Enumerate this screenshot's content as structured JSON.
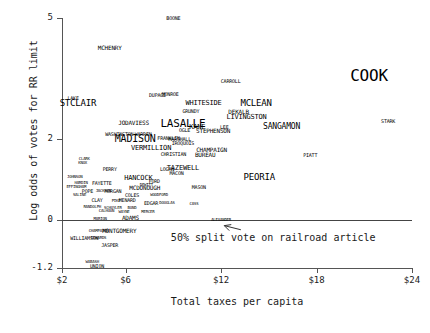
{
  "chart_data": {
    "type": "scatter",
    "title": "",
    "xlabel": "Total taxes per capita",
    "ylabel": "Log odds of votes for RR limit",
    "xlim": [
      2,
      24
    ],
    "ylim": [
      -1.2,
      5
    ],
    "xticks": [
      "$2",
      "$6",
      "$12",
      "$18",
      "$24"
    ],
    "xtick_values": [
      2,
      6,
      12,
      18,
      24
    ],
    "yticks": [
      "5",
      "2",
      "0",
      "-1.2"
    ],
    "ytick_values": [
      5,
      2,
      0,
      -1.2
    ],
    "grid": false,
    "legend": "none",
    "annotations": [
      {
        "text": "50% split vote on railroad article",
        "x": 14.5,
        "y": -0.45,
        "arrow_to_x": 12.2,
        "arrow_to_y": 0.0
      }
    ],
    "reference_lines": [
      {
        "y": 0,
        "label": "50% split vote on railroad article"
      }
    ],
    "point_label_field": "county",
    "points": [
      {
        "county": "BOONE",
        "x": 9.0,
        "y": 5.0,
        "size": 5
      },
      {
        "county": "MCHENRY",
        "x": 5.0,
        "y": 4.25,
        "size": 6
      },
      {
        "county": "CARROLL",
        "x": 12.6,
        "y": 3.45,
        "size": 5
      },
      {
        "county": "DUPAGE",
        "x": 8.0,
        "y": 3.1,
        "size": 5
      },
      {
        "county": "MONROE",
        "x": 8.8,
        "y": 3.12,
        "size": 5
      },
      {
        "county": "LAKE",
        "x": 2.7,
        "y": 3.02,
        "size": 5
      },
      {
        "county": "STCLAIR",
        "x": 3.0,
        "y": 2.9,
        "size": 9
      },
      {
        "county": "WHITESIDE",
        "x": 10.9,
        "y": 2.88,
        "size": 7
      },
      {
        "county": "MCLEAN",
        "x": 14.2,
        "y": 2.9,
        "size": 9
      },
      {
        "county": "GRUNDY",
        "x": 10.1,
        "y": 2.7,
        "size": 5
      },
      {
        "county": "DEKALB",
        "x": 13.1,
        "y": 2.68,
        "size": 6
      },
      {
        "county": "LIVINGSTON",
        "x": 13.6,
        "y": 2.55,
        "size": 7
      },
      {
        "county": "JODAVIESS",
        "x": 6.5,
        "y": 2.4,
        "size": 6
      },
      {
        "county": "LASALLE",
        "x": 9.6,
        "y": 2.4,
        "size": 11
      },
      {
        "county": "KANE",
        "x": 10.5,
        "y": 2.3,
        "size": 7
      },
      {
        "county": "LEE",
        "x": 12.2,
        "y": 2.3,
        "size": 5
      },
      {
        "county": "OGLE",
        "x": 9.7,
        "y": 2.22,
        "size": 5
      },
      {
        "county": "STEPHENSON",
        "x": 11.5,
        "y": 2.2,
        "size": 6
      },
      {
        "county": "WASHINGTON",
        "x": 5.6,
        "y": 2.12,
        "size": 5
      },
      {
        "county": "WARREN",
        "x": 7.1,
        "y": 2.12,
        "size": 5
      },
      {
        "county": "MADISON",
        "x": 6.6,
        "y": 2.0,
        "size": 10
      },
      {
        "county": "MARSHALL",
        "x": 9.4,
        "y": 2.0,
        "size": 5
      },
      {
        "county": "FRANKLIN",
        "x": 8.7,
        "y": 2.02,
        "size": 5
      },
      {
        "county": "IROQUOIS",
        "x": 9.6,
        "y": 1.9,
        "size": 5
      },
      {
        "county": "VERMILLION",
        "x": 7.6,
        "y": 1.78,
        "size": 7
      },
      {
        "county": "CHAMPAIGN",
        "x": 11.4,
        "y": 1.72,
        "size": 6
      },
      {
        "county": "CHRISTIAN",
        "x": 9.0,
        "y": 1.62,
        "size": 5
      },
      {
        "county": "BUREAU",
        "x": 11.0,
        "y": 1.6,
        "size": 6
      },
      {
        "county": "CLARK",
        "x": 3.4,
        "y": 1.5,
        "size": 4
      },
      {
        "county": "KNOX",
        "x": 3.3,
        "y": 1.4,
        "size": 4
      },
      {
        "county": "PERRY",
        "x": 5.0,
        "y": 1.25,
        "size": 5
      },
      {
        "county": "LOGAN",
        "x": 8.6,
        "y": 1.25,
        "size": 5
      },
      {
        "county": "TAZEWELL",
        "x": 9.6,
        "y": 1.28,
        "size": 7
      },
      {
        "county": "MACON",
        "x": 9.2,
        "y": 1.15,
        "size": 5
      },
      {
        "county": "JOHNSON",
        "x": 2.8,
        "y": 1.05,
        "size": 4
      },
      {
        "county": "HANCOCK",
        "x": 6.8,
        "y": 1.02,
        "size": 7
      },
      {
        "county": "PEORIA",
        "x": 14.4,
        "y": 1.05,
        "size": 9
      },
      {
        "county": "HARDIN",
        "x": 3.2,
        "y": 0.92,
        "size": 4
      },
      {
        "county": "FAYETTE",
        "x": 4.5,
        "y": 0.92,
        "size": 5
      },
      {
        "county": "FORD",
        "x": 7.8,
        "y": 0.95,
        "size": 5
      },
      {
        "county": "DEWITT",
        "x": 7.3,
        "y": 0.85,
        "size": 4
      },
      {
        "county": "EFFINGHAM",
        "x": 2.9,
        "y": 0.8,
        "size": 4
      },
      {
        "county": "MCDONOUGH",
        "x": 7.2,
        "y": 0.78,
        "size": 6
      },
      {
        "county": "MASON",
        "x": 10.6,
        "y": 0.82,
        "size": 5
      },
      {
        "county": "POPE",
        "x": 3.6,
        "y": 0.72,
        "size": 5
      },
      {
        "county": "JACKSON",
        "x": 4.6,
        "y": 0.7,
        "size": 4
      },
      {
        "county": "MORGAN",
        "x": 5.2,
        "y": 0.72,
        "size": 5
      },
      {
        "county": "SALINE",
        "x": 3.1,
        "y": 0.6,
        "size": 4
      },
      {
        "county": "COLES",
        "x": 6.4,
        "y": 0.6,
        "size": 5
      },
      {
        "county": "WOODFORD",
        "x": 8.1,
        "y": 0.6,
        "size": 4
      },
      {
        "county": "CLAY",
        "x": 4.2,
        "y": 0.48,
        "size": 5
      },
      {
        "county": "MENARD",
        "x": 6.1,
        "y": 0.48,
        "size": 5
      },
      {
        "county": "PIKE",
        "x": 5.4,
        "y": 0.45,
        "size": 4
      },
      {
        "county": "EDGAR",
        "x": 7.6,
        "y": 0.42,
        "size": 5
      },
      {
        "county": "DOUGLAS",
        "x": 8.6,
        "y": 0.42,
        "size": 4
      },
      {
        "county": "CASS",
        "x": 10.3,
        "y": 0.38,
        "size": 4
      },
      {
        "county": "RANDOLPH",
        "x": 3.9,
        "y": 0.32,
        "size": 4
      },
      {
        "county": "SCHUYLER",
        "x": 5.2,
        "y": 0.3,
        "size": 4
      },
      {
        "county": "BOND",
        "x": 6.4,
        "y": 0.3,
        "size": 4
      },
      {
        "county": "CALHOUN",
        "x": 4.8,
        "y": 0.22,
        "size": 4
      },
      {
        "county": "WAYNE",
        "x": 5.9,
        "y": 0.2,
        "size": 4
      },
      {
        "county": "MERCER",
        "x": 7.4,
        "y": 0.2,
        "size": 4
      },
      {
        "county": "ADAMS",
        "x": 6.3,
        "y": 0.05,
        "size": 6
      },
      {
        "county": "MARION",
        "x": 4.4,
        "y": 0.02,
        "size": 4
      },
      {
        "county": "ALEXANDER",
        "x": 12.0,
        "y": 0.0,
        "size": 4
      },
      {
        "county": "CHAMPAIGN2",
        "x": 4.3,
        "y": -0.28,
        "size": 4
      },
      {
        "county": "MONTGOMERY",
        "x": 5.6,
        "y": -0.28,
        "size": 6
      },
      {
        "county": "WILLIAMSON",
        "x": 3.4,
        "y": -0.45,
        "size": 5
      },
      {
        "county": "EDWARDS",
        "x": 4.3,
        "y": -0.45,
        "size": 4
      },
      {
        "county": "JASPER",
        "x": 5.0,
        "y": -0.62,
        "size": 5
      },
      {
        "county": "WABASH",
        "x": 3.9,
        "y": -1.05,
        "size": 4
      },
      {
        "county": "UNION",
        "x": 4.2,
        "y": -1.15,
        "size": 5
      },
      {
        "county": "STARK",
        "x": 22.5,
        "y": 2.45,
        "size": 5
      },
      {
        "county": "PIATT",
        "x": 17.6,
        "y": 1.6,
        "size": 5
      },
      {
        "county": "SANGAMON",
        "x": 15.8,
        "y": 2.3,
        "size": 8
      },
      {
        "county": "COOK",
        "x": 21.3,
        "y": 3.55,
        "size": 16
      }
    ]
  }
}
